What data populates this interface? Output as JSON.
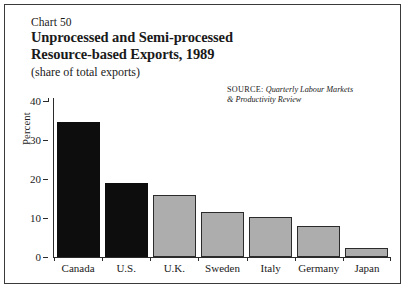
{
  "figure": {
    "chart_number": "Chart 50",
    "title_line1": "Unprocessed and Semi-processed",
    "title_line2": "Resource-based Exports, 1989",
    "subtitle": "(share of total exports)",
    "source_label": "SOURCE:",
    "source_title_line1": "Quarterly Labour Markets",
    "source_title_line2": "& Productivity Review"
  },
  "colors": {
    "bar_dark": "#0d0d0d",
    "bar_light": "#adadad",
    "axis": "#2b2b2b",
    "frame": "#3a3a3a",
    "background": "#ffffff"
  },
  "chart_data": {
    "type": "bar",
    "title": "Unprocessed and Semi-processed Resource-based Exports, 1989",
    "subtitle": "(share of total exports)",
    "xlabel": "",
    "ylabel": "Percent",
    "ylim": [
      0,
      40
    ],
    "yticks": [
      0,
      10,
      20,
      30,
      40
    ],
    "ytick_labels": [
      "0",
      "10",
      "20",
      "30",
      "40"
    ],
    "grid": false,
    "legend": false,
    "categories": [
      "Canada",
      "U.S.",
      "U.K.",
      "Sweden",
      "Italy",
      "Germany",
      "Japan"
    ],
    "values": [
      34.5,
      19,
      16,
      11.5,
      10.3,
      8,
      2.3
    ],
    "bar_styles": [
      "dark",
      "dark",
      "light",
      "light",
      "light",
      "light",
      "light"
    ],
    "source": "SOURCE: Quarterly Labour Markets & Productivity Review"
  }
}
